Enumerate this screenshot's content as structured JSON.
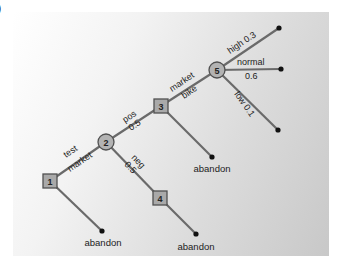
{
  "figure": {
    "panel_label": ")"
  },
  "nodes": [
    {
      "id": "1",
      "type": "decision",
      "x": 50,
      "y": 181
    },
    {
      "id": "2",
      "type": "chance",
      "x": 106,
      "y": 142
    },
    {
      "id": "3",
      "type": "decision",
      "x": 161,
      "y": 106
    },
    {
      "id": "4",
      "type": "decision",
      "x": 160,
      "y": 198
    },
    {
      "id": "5",
      "type": "chance",
      "x": 217,
      "y": 70
    }
  ],
  "edges": {
    "test_market": {
      "line1": "test",
      "line2": "market"
    },
    "pos": {
      "line1": "pos",
      "line2": "0.5"
    },
    "neg": {
      "line1": "neg",
      "line2": "0.5"
    },
    "market_bike": {
      "line1": "market",
      "line2": "bike"
    },
    "high": {
      "line1": "high 0.3"
    },
    "normal": {
      "line1": "normal",
      "line2": "0.6"
    },
    "low": {
      "line1": "low 0.1"
    }
  },
  "terminals": {
    "abandon_1": "abandon",
    "abandon_3": "abandon",
    "abandon_4": "abandon"
  },
  "colors": {
    "edge": "#6a6a6a",
    "node_fill": "#a9a9a9",
    "node_stroke": "#505050",
    "dot": "#111111"
  }
}
